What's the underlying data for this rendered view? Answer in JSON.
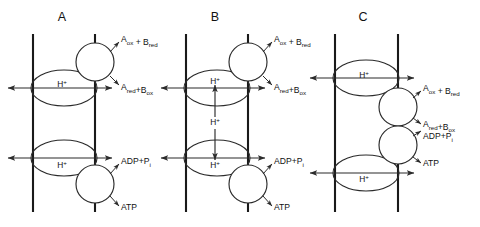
{
  "figure": {
    "background_color": "#ffffff",
    "stroke_color": "#2b2b2b",
    "membrane_color": "#1a1a1a",
    "width": 480,
    "height": 227
  },
  "common_labels": {
    "proton": "H",
    "proton_charge": "+",
    "redox_top_main_a": "A",
    "redox_top_sub_a": "ox",
    "redox_top_plus": " + ",
    "redox_top_main_b": "B",
    "redox_top_sub_b": "red",
    "redox_bottom_main_a": "A",
    "redox_bottom_sub_a": "red",
    "redox_bottom_plus": "+",
    "redox_bottom_main_b": "B",
    "redox_bottom_sub_b": "ox",
    "adp_main": "ADP",
    "adp_plus": "+",
    "adp_p": "P",
    "adp_p_sub": "i",
    "atp": "ATP"
  },
  "panels": [
    {
      "id": "panel-a",
      "letter": "A",
      "letter_x": 62,
      "letter_y": 18,
      "membrane_left_x": 33,
      "membrane_right_x": 95,
      "membrane_top_y": 34,
      "membrane_bottom_y": 212,
      "vesicles": [
        {
          "name": "upper-proton-loop",
          "cx": 64,
          "cy": 88,
          "rx": 33,
          "ry": 18,
          "label": "H",
          "label_x": 62,
          "label_y": 85
        },
        {
          "name": "lower-proton-loop",
          "cx": 64,
          "cy": 158,
          "rx": 33,
          "ry": 18,
          "label": "H",
          "label_x": 62,
          "label_y": 166
        }
      ],
      "complexes": [
        {
          "name": "redox-complex",
          "cx": 95,
          "cy": 62,
          "r": 19
        },
        {
          "name": "atp-synthase-complex",
          "cx": 95,
          "cy": 184,
          "r": 19
        }
      ],
      "flow_arrows": [
        {
          "name": "upper-proton-flow",
          "y": 88,
          "x1": 8,
          "x2": 112,
          "double": true
        },
        {
          "name": "lower-proton-flow",
          "y": 158,
          "x1": 8,
          "x2": 112,
          "double": true
        }
      ],
      "vertical_proton_arrow": null,
      "substrate_arrows": [
        {
          "name": "redox-substrate-in",
          "x1": 110,
          "y1": 52,
          "x2": 119,
          "y2": 42,
          "label_x": 121,
          "label_y": 40,
          "label_type": "redox_top"
        },
        {
          "name": "redox-substrate-out",
          "x1": 110,
          "y1": 76,
          "x2": 119,
          "y2": 85,
          "label_x": 121,
          "label_y": 88,
          "label_type": "redox_bottom"
        },
        {
          "name": "adp-pi-in",
          "x1": 110,
          "y1": 174,
          "x2": 119,
          "y2": 164,
          "label_x": 121,
          "label_y": 162,
          "label_type": "adp"
        },
        {
          "name": "atp-out",
          "x1": 110,
          "y1": 196,
          "x2": 119,
          "y2": 206,
          "label_x": 121,
          "label_y": 208,
          "label_type": "atp"
        }
      ]
    },
    {
      "id": "panel-b",
      "letter": "B",
      "letter_x": 215,
      "letter_y": 18,
      "membrane_left_x": 186,
      "membrane_right_x": 248,
      "membrane_top_y": 34,
      "membrane_bottom_y": 212,
      "vesicles": [
        {
          "name": "upper-proton-loop",
          "cx": 217,
          "cy": 88,
          "rx": 33,
          "ry": 18,
          "label": "H",
          "label_x": 215,
          "label_y": 82
        },
        {
          "name": "lower-proton-loop",
          "cx": 217,
          "cy": 158,
          "rx": 33,
          "ry": 18,
          "label": "H",
          "label_x": 215,
          "label_y": 166
        }
      ],
      "complexes": [
        {
          "name": "redox-complex",
          "cx": 248,
          "cy": 62,
          "r": 19
        },
        {
          "name": "atp-synthase-complex",
          "cx": 248,
          "cy": 184,
          "r": 19
        }
      ],
      "flow_arrows": [
        {
          "name": "upper-proton-flow",
          "y": 88,
          "x1": 161,
          "x2": 265,
          "double": true
        },
        {
          "name": "lower-proton-flow",
          "y": 158,
          "x1": 161,
          "x2": 265,
          "double": true
        }
      ],
      "vertical_proton_arrow": {
        "name": "interior-proton-flow",
        "x": 215,
        "y1": 85,
        "y2": 160,
        "label": "H",
        "label_x": 215,
        "label_y": 123
      },
      "substrate_arrows": [
        {
          "name": "redox-substrate-in",
          "x1": 263,
          "y1": 52,
          "x2": 272,
          "y2": 42,
          "label_x": 274,
          "label_y": 40,
          "label_type": "redox_top"
        },
        {
          "name": "redox-substrate-out",
          "x1": 263,
          "y1": 76,
          "x2": 272,
          "y2": 85,
          "label_x": 274,
          "label_y": 88,
          "label_type": "redox_bottom"
        },
        {
          "name": "adp-pi-in",
          "x1": 263,
          "y1": 174,
          "x2": 272,
          "y2": 164,
          "label_x": 274,
          "label_y": 162,
          "label_type": "adp"
        },
        {
          "name": "atp-out",
          "x1": 263,
          "y1": 196,
          "x2": 272,
          "y2": 206,
          "label_x": 274,
          "label_y": 208,
          "label_type": "atp"
        }
      ]
    },
    {
      "id": "panel-c",
      "letter": "C",
      "letter_x": 363,
      "letter_y": 18,
      "membrane_left_x": 335,
      "membrane_right_x": 398,
      "membrane_top_y": 34,
      "membrane_bottom_y": 212,
      "vesicles": [
        {
          "name": "upper-proton-loop",
          "cx": 366,
          "cy": 78,
          "rx": 33,
          "ry": 18,
          "label": "H",
          "label_x": 364,
          "label_y": 76
        },
        {
          "name": "lower-proton-loop",
          "cx": 366,
          "cy": 173,
          "rx": 33,
          "ry": 18,
          "label": "H",
          "label_x": 364,
          "label_y": 180
        }
      ],
      "complexes": [
        {
          "name": "redox-complex",
          "cx": 398,
          "cy": 107,
          "r": 19
        },
        {
          "name": "atp-synthase-complex",
          "cx": 398,
          "cy": 145,
          "r": 19
        }
      ],
      "flow_arrows": [
        {
          "name": "upper-proton-flow",
          "y": 78,
          "x1": 310,
          "x2": 414,
          "double": true
        },
        {
          "name": "lower-proton-flow",
          "y": 173,
          "x1": 310,
          "x2": 414,
          "double": true
        }
      ],
      "vertical_proton_arrow": null,
      "substrate_arrows": [
        {
          "name": "redox-substrate-in",
          "x1": 413,
          "y1": 98,
          "x2": 421,
          "y2": 91,
          "label_x": 423,
          "label_y": 89,
          "label_type": "redox_top"
        },
        {
          "name": "redox-substrate-out",
          "x1": 413,
          "y1": 118,
          "x2": 421,
          "y2": 124,
          "label_x": 423,
          "label_y": 125,
          "label_type": "redox_bottom"
        },
        {
          "name": "adp-pi-in",
          "x1": 413,
          "y1": 136,
          "x2": 421,
          "y2": 131,
          "label_x": 423,
          "label_y": 137,
          "label_type": "adp"
        },
        {
          "name": "atp-out",
          "x1": 413,
          "y1": 157,
          "x2": 421,
          "y2": 163,
          "label_x": 423,
          "label_y": 164,
          "label_type": "atp"
        }
      ]
    }
  ]
}
